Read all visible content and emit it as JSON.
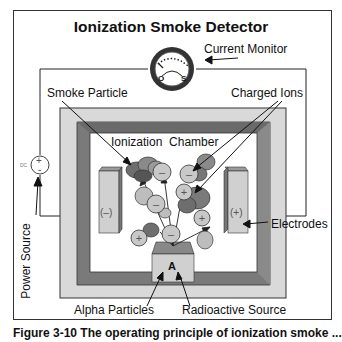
{
  "diagram": {
    "title": "Ionization Smoke Detector",
    "labels": {
      "current_monitor": "Current Monitor",
      "smoke_particle": "Smoke Particle",
      "charged_ions": "Charged Ions",
      "ionization_chamber": "Ionization  Chamber",
      "electrodes": "Electrodes",
      "power_source": "Power Source",
      "alpha_particles": "Alpha Particles",
      "radioactive_source": "Radioactive Source"
    },
    "electrodes": {
      "negative": "(–)",
      "positive": "(+)"
    },
    "source_symbol": "A",
    "meter": {
      "zero": "O",
      "scale": "S"
    },
    "power": {
      "dc": "DC",
      "plus": "+",
      "minus": "-"
    },
    "ion_signs": {
      "plus": "+",
      "minus": "–"
    }
  },
  "caption": "Figure 3-10 The operating principle of ionization smoke ...",
  "colors": {
    "outer_box": "#d9d9d9",
    "frame": "#7a7a7a",
    "chamber": "#ffffff",
    "electrode": "#d0d0d0",
    "smoke_dark": "#6e6e6e",
    "smoke_light": "#bdbdbd",
    "ion": "#c8c8c8"
  }
}
